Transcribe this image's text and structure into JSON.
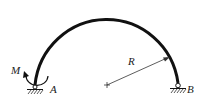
{
  "diagram": {
    "type": "semicircular-arch",
    "labels": {
      "moment": "M",
      "support_left": "A",
      "support_right": "B",
      "radius": "R"
    },
    "colors": {
      "stroke": "#111111",
      "background": "#ffffff"
    }
  }
}
